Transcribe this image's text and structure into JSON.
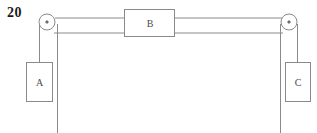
{
  "figure": {
    "problem_number": "20",
    "type": "physics-free-body-pulley-diagram",
    "stroke_color": "#8a8a8a",
    "label_color": "#4a4a4a",
    "number_color": "#1a1a1a",
    "background": "#ffffff"
  },
  "blocks": {
    "a": {
      "label": "A",
      "x": 26,
      "y": 62,
      "w": 26,
      "h": 40,
      "label_x": 39,
      "label_y": 86
    },
    "b": {
      "label": "B",
      "x": 124,
      "y": 9,
      "w": 51,
      "h": 28,
      "label_x": 150,
      "label_y": 27
    },
    "c": {
      "label": "C",
      "x": 285,
      "y": 62,
      "w": 26,
      "h": 40,
      "label_x": 298,
      "label_y": 86
    }
  },
  "pulleys": {
    "left": {
      "name": "left-pulley",
      "cx": 47,
      "cy": 22,
      "r": 8,
      "hub_r": 1.4
    },
    "right": {
      "name": "right-pulley",
      "cx": 289,
      "cy": 22,
      "r": 8,
      "hub_r": 1.4
    }
  },
  "ropes": {
    "top_left_segment": {
      "x1": 55,
      "y1": 18,
      "x2": 124,
      "y2": 18
    },
    "top_right_segment": {
      "x1": 175,
      "y1": 18,
      "x2": 281,
      "y2": 18
    },
    "lower_left_segment": {
      "x1": 55,
      "y1": 33,
      "x2": 124,
      "y2": 33
    },
    "lower_right_segment": {
      "x1": 175,
      "y1": 33,
      "x2": 281,
      "y2": 33
    },
    "left_hanging_to_a": {
      "x1": 39,
      "y1": 29,
      "x2": 39,
      "y2": 62
    },
    "right_hanging_to_c": {
      "x1": 297,
      "y1": 29,
      "x2": 297,
      "y2": 62
    },
    "left_vertical_drop": {
      "x1": 57,
      "y1": 24,
      "x2": 57,
      "y2": 133
    },
    "right_vertical_drop": {
      "x1": 280,
      "y1": 24,
      "x2": 280,
      "y2": 133
    }
  }
}
